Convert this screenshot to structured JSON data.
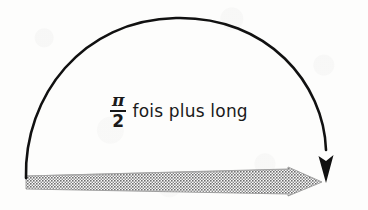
{
  "figure": {
    "kind": "geometry-diagram",
    "caption_label": {
      "fraction_numerator": "π",
      "fraction_denominator": "2",
      "text": "fois plus long",
      "full_text": "π/2 fois plus long"
    },
    "colors": {
      "arc_stroke": "#111111",
      "arrow_fill_gray": "#8f8f8f",
      "arrow_outline": "#6f6f6f",
      "background": "#fdfdfc",
      "text": "#1a1a1a"
    },
    "elements": {
      "arc_name": "semicircular-arc",
      "arc_arrowhead_name": "arc-arrowhead-down",
      "baseline_arrow_name": "horizontal-gray-arrow",
      "baseline_arrow_texture": "halftone-checker"
    },
    "geometry": {
      "arc_start_x": 26,
      "arc_start_y": 178,
      "arc_apex_x": 176,
      "arc_apex_y": 18,
      "arc_end_x": 326,
      "arc_end_y": 152,
      "baseline_y_top": 176,
      "baseline_y_bottom": 189,
      "baseline_x_start": 26,
      "baseline_x_shaft_end": 288,
      "arrowhead_tip_x": 322,
      "arrowhead_top_y": 167,
      "arrowhead_bottom_y": 197
    }
  }
}
